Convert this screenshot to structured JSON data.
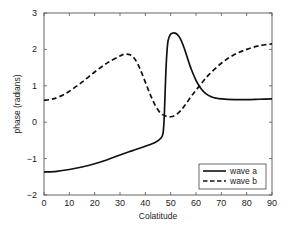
{
  "chart_data": {
    "type": "line",
    "title": "",
    "xlabel": "Colatitude",
    "ylabel": "phase (radians)",
    "xlim": [
      0,
      90
    ],
    "ylim": [
      -2,
      3
    ],
    "xticks": [
      0,
      10,
      20,
      30,
      40,
      50,
      60,
      70,
      80,
      90
    ],
    "yticks": [
      -2,
      -1,
      0,
      1,
      2,
      3
    ],
    "grid": false,
    "legend_position": "lower right",
    "series": [
      {
        "name": "wave a",
        "style": "solid",
        "x": [
          0,
          5,
          10,
          15,
          20,
          25,
          30,
          35,
          40,
          44,
          46,
          47,
          47.5,
          48,
          48.5,
          49,
          50,
          51,
          52,
          53,
          54,
          55,
          56,
          57,
          58,
          60,
          62,
          64,
          66,
          68,
          70,
          75,
          80,
          85,
          90
        ],
        "y": [
          -1.37,
          -1.35,
          -1.3,
          -1.23,
          -1.14,
          -1.03,
          -0.9,
          -0.78,
          -0.66,
          -0.55,
          -0.45,
          -0.3,
          0.2,
          1.2,
          1.9,
          2.25,
          2.42,
          2.45,
          2.44,
          2.38,
          2.27,
          2.1,
          1.9,
          1.68,
          1.48,
          1.15,
          0.92,
          0.78,
          0.7,
          0.66,
          0.64,
          0.62,
          0.62,
          0.63,
          0.64
        ]
      },
      {
        "name": "wave b",
        "style": "dashed",
        "x": [
          0,
          3,
          6,
          10,
          15,
          20,
          25,
          30,
          32,
          34,
          36,
          38,
          40,
          42,
          44,
          46,
          48,
          50,
          52,
          54,
          56,
          58,
          60,
          62,
          65,
          70,
          75,
          80,
          85,
          90
        ],
        "y": [
          0.6,
          0.63,
          0.7,
          0.85,
          1.1,
          1.38,
          1.63,
          1.82,
          1.87,
          1.85,
          1.72,
          1.45,
          1.1,
          0.75,
          0.45,
          0.25,
          0.17,
          0.15,
          0.2,
          0.32,
          0.5,
          0.7,
          0.88,
          1.05,
          1.3,
          1.62,
          1.85,
          2.0,
          2.1,
          2.15
        ]
      }
    ]
  },
  "legend": {
    "items": [
      {
        "label": "wave a",
        "style": "solid"
      },
      {
        "label": "wave b",
        "style": "dashed"
      }
    ]
  },
  "colors": {
    "line": "#111111",
    "axis": "#555555",
    "background": "#ffffff"
  }
}
